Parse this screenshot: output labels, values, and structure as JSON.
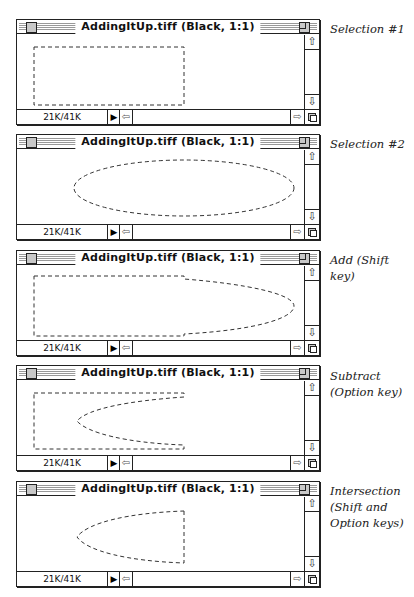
{
  "windows": [
    {
      "title": "AddingItUp.tiff (Black, 1:1)",
      "size": "21K/41K",
      "caption": "Selection #1",
      "selection": "rectangle"
    },
    {
      "title": "AddingItUp.tiff (Black, 1:1)",
      "size": "21K/41K",
      "caption": "Selection #2",
      "selection": "ellipse"
    },
    {
      "title": "AddingItUp.tiff (Black, 1:1)",
      "size": "21K/41K",
      "caption": "Add (Shift key)",
      "selection": "union"
    },
    {
      "title": "AddingItUp.tiff (Black, 1:1)",
      "size": "21K/41K",
      "caption_lines": [
        "Subtract",
        "(Option key)"
      ],
      "selection": "subtract"
    },
    {
      "title": "AddingItUp.tiff (Black, 1:1)",
      "size": "21K/41K",
      "caption_lines": [
        "Intersection",
        "(Shift and",
        "Option keys)"
      ],
      "selection": "intersection"
    }
  ],
  "icons": {
    "scroll_up": "⇧",
    "scroll_down": "⇩",
    "scroll_left": "⇦",
    "scroll_right": "⇨",
    "triangle": "▶"
  }
}
